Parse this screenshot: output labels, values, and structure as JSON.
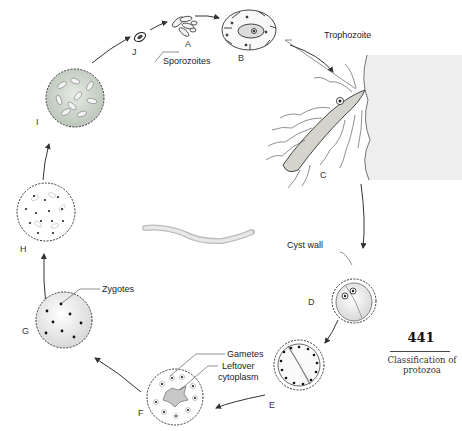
{
  "figure": {
    "stages": [
      {
        "id": "A",
        "label": "A"
      },
      {
        "id": "B",
        "label": "B"
      },
      {
        "id": "C",
        "label": "C"
      },
      {
        "id": "D",
        "label": "D"
      },
      {
        "id": "E",
        "label": "E"
      },
      {
        "id": "F",
        "label": "F"
      },
      {
        "id": "G",
        "label": "G"
      },
      {
        "id": "H",
        "label": "H"
      },
      {
        "id": "I",
        "label": "I"
      },
      {
        "id": "J",
        "label": "J"
      }
    ],
    "callouts": {
      "sporozoites": "Sporozoites",
      "trophozoite": "Trophozoite",
      "cyst_wall": "Cyst wall",
      "gametes": "Gametes",
      "leftover_cytoplasm_line1": "Leftover",
      "leftover_cytoplasm_line2": "cytoplasm",
      "zygotes": "Zygotes"
    }
  },
  "page": {
    "number": "441",
    "section_line1": "Classification of",
    "section_line2": "protozoa"
  }
}
